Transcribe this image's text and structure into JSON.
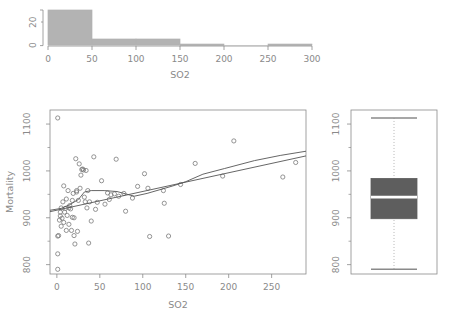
{
  "figure": {
    "panels": [
      "histogram",
      "scatter",
      "boxplot"
    ],
    "variable_x": "SO2",
    "variable_y": "Mortality"
  },
  "colors": {
    "hist_fill": "#b3b3b3",
    "hist_border": "#b3b3b3",
    "box_fill": "#5e5e5e",
    "box_median": "#ffffff",
    "axis": "#8a8a8a",
    "point": "#7a7a7a",
    "line": "#555555",
    "background": "#ffffff"
  },
  "chart_data": [
    {
      "type": "bar",
      "name": "so2-histogram",
      "title": "",
      "xlabel": "SO2",
      "ylabel": "",
      "xlim": [
        0,
        300
      ],
      "ylim": [
        0,
        34
      ],
      "xticks": [
        0,
        50,
        100,
        150,
        200,
        250,
        300
      ],
      "xtick_labels": [
        "0",
        "50",
        "100",
        "150",
        "200",
        "250",
        "300"
      ],
      "yticks": [
        0,
        20
      ],
      "ytick_labels": [
        "0",
        "20"
      ],
      "bin_width": 50,
      "bin_edges": [
        0,
        50,
        100,
        150,
        200,
        250,
        300
      ],
      "categories": [
        "0-50",
        "50-100",
        "100-150",
        "150-200",
        "200-250",
        "250-300"
      ],
      "values": [
        31,
        5,
        5,
        1,
        0,
        1
      ],
      "grid": false,
      "legend": false
    },
    {
      "type": "scatter",
      "name": "mortality-vs-so2",
      "title": "",
      "xlabel": "SO2",
      "ylabel": "Mortality",
      "xlim": [
        -8,
        290
      ],
      "ylim": [
        780,
        1130
      ],
      "xticks": [
        0,
        50,
        100,
        150,
        200,
        250
      ],
      "xtick_labels": [
        "0",
        "50",
        "100",
        "150",
        "200",
        "250"
      ],
      "yticks": [
        800,
        900,
        1000,
        1100
      ],
      "ytick_labels": [
        "800",
        "900",
        "1000",
        "1100"
      ],
      "grid": false,
      "legend": false,
      "point_marker": "open-circle",
      "points": [
        [
          1,
          1113
        ],
        [
          1,
          790
        ],
        [
          1,
          823
        ],
        [
          1,
          861
        ],
        [
          2,
          862
        ],
        [
          3,
          895
        ],
        [
          4,
          904
        ],
        [
          4,
          912
        ],
        [
          5,
          921
        ],
        [
          5,
          882
        ],
        [
          6,
          899
        ],
        [
          7,
          934
        ],
        [
          8,
          968
        ],
        [
          8,
          890
        ],
        [
          9,
          912
        ],
        [
          10,
          920
        ],
        [
          11,
          940
        ],
        [
          11,
          873
        ],
        [
          12,
          905
        ],
        [
          13,
          958
        ],
        [
          14,
          921
        ],
        [
          14,
          886
        ],
        [
          15,
          926
        ],
        [
          16,
          919
        ],
        [
          17,
          873
        ],
        [
          18,
          901
        ],
        [
          18,
          937
        ],
        [
          19,
          952
        ],
        [
          20,
          900
        ],
        [
          20,
          862
        ],
        [
          21,
          844
        ],
        [
          22,
          1026
        ],
        [
          23,
          955
        ],
        [
          23,
          958
        ],
        [
          24,
          871
        ],
        [
          25,
          937
        ],
        [
          26,
          1015
        ],
        [
          27,
          963
        ],
        [
          28,
          991
        ],
        [
          29,
          1003
        ],
        [
          30,
          1004
        ],
        [
          31,
          1002
        ],
        [
          32,
          944
        ],
        [
          33,
          934
        ],
        [
          34,
          1001
        ],
        [
          35,
          921
        ],
        [
          36,
          958
        ],
        [
          37,
          846
        ],
        [
          38,
          934
        ],
        [
          40,
          893
        ],
        [
          43,
          1030
        ],
        [
          45,
          918
        ],
        [
          47,
          933
        ],
        [
          52,
          979
        ],
        [
          56,
          929
        ],
        [
          59,
          953
        ],
        [
          61,
          939
        ],
        [
          63,
          949
        ],
        [
          67,
          951
        ],
        [
          69,
          1025
        ],
        [
          72,
          946
        ],
        [
          78,
          952
        ],
        [
          80,
          914
        ],
        [
          88,
          942
        ],
        [
          94,
          967
        ],
        [
          102,
          994
        ],
        [
          106,
          963
        ],
        [
          108,
          860
        ],
        [
          124,
          958
        ],
        [
          125,
          931
        ],
        [
          130,
          861
        ],
        [
          144,
          971
        ],
        [
          161,
          1016
        ],
        [
          193,
          989
        ],
        [
          206,
          1064
        ],
        [
          263,
          987
        ],
        [
          278,
          1018
        ]
      ],
      "fitted_lines": [
        {
          "name": "linear-regression",
          "style": "solid",
          "points": [
            [
              -8,
              913
            ],
            [
              290,
              1032
            ]
          ]
        },
        {
          "name": "loess-smoother",
          "style": "solid",
          "points": [
            [
              -8,
              916
            ],
            [
              5,
              920
            ],
            [
              15,
              928
            ],
            [
              25,
              939
            ],
            [
              32,
              955
            ],
            [
              40,
              958
            ],
            [
              55,
              958
            ],
            [
              70,
              956
            ],
            [
              80,
              951
            ],
            [
              90,
              946
            ],
            [
              105,
              952
            ],
            [
              120,
              960
            ],
            [
              135,
              968
            ],
            [
              150,
              977
            ],
            [
              170,
              993
            ],
            [
              195,
              1005
            ],
            [
              230,
              1022
            ],
            [
              260,
              1033
            ],
            [
              290,
              1042
            ]
          ]
        }
      ]
    },
    {
      "type": "box",
      "name": "mortality-boxplot",
      "title": "",
      "xlabel": "",
      "ylabel": "",
      "ylim": [
        780,
        1130
      ],
      "yticks": [
        800,
        900,
        1000,
        1100
      ],
      "ytick_labels": [
        "800",
        "900",
        "1100"
      ],
      "ytick_labels_full": [
        "800",
        "900",
        "1000",
        "1100"
      ],
      "grid": false,
      "legend": false,
      "whisker_style": "dotted",
      "stats": {
        "min": 790,
        "q1": 898,
        "median": 944,
        "q3": 984,
        "max": 1113
      },
      "outliers": []
    }
  ]
}
